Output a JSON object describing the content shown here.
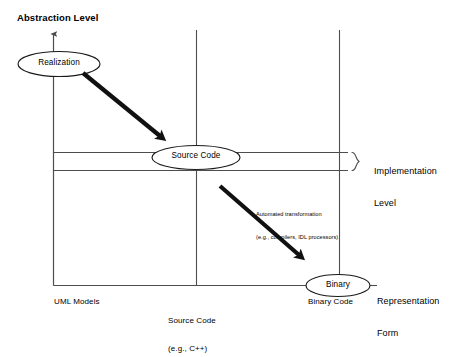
{
  "diagram": {
    "title_axis_y": "Abstraction Level",
    "axes": {
      "y_label": "Abstraction Level",
      "x_tick_labels": [
        {
          "id": "uml",
          "text": "UML Models"
        },
        {
          "id": "source",
          "line1": "Source Code",
          "line2": "(e.g., C++)"
        },
        {
          "id": "binary",
          "text": "Binary Code"
        }
      ]
    },
    "bands": [
      {
        "id": "implementation",
        "line1": "Implementation",
        "line2": "Level"
      }
    ],
    "side_labels": [
      {
        "id": "representation-form",
        "line1": "Representation",
        "line2": "Form"
      }
    ],
    "nodes": [
      {
        "id": "realization",
        "label": "Realization"
      },
      {
        "id": "source-code",
        "label": "Source Code"
      },
      {
        "id": "binary",
        "label": "Binary"
      }
    ],
    "arrows": [
      {
        "id": "realization-arrow",
        "label": ""
      },
      {
        "id": "automated-transformation-arrow",
        "line1": "Automated transformation",
        "line2": "(e.g., compilers, IDL processors)"
      }
    ],
    "colors": {
      "stroke": "#4d4d4d",
      "node_stroke": "#1a1a1a",
      "arrow": "#111111",
      "text": "#000000",
      "background": "#ffffff"
    }
  }
}
